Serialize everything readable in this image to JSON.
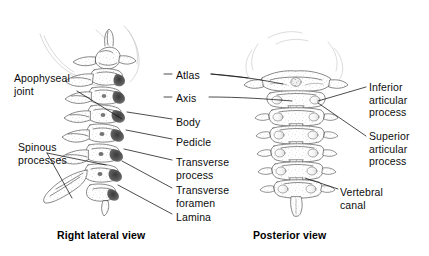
{
  "figure": {
    "background_color": "#ffffff",
    "ink_color": "#1a1a1a",
    "width": 429,
    "height": 256
  },
  "views": {
    "lateral": {
      "caption": "Right lateral view",
      "vertebra_count": 7
    },
    "posterior": {
      "caption": "Posterior view",
      "vertebra_count": 7
    }
  },
  "labels": {
    "apophyseal_joint": "Apophyseal\njoint",
    "spinous_processes": "Spinous\nprocesses",
    "atlas": "Atlas",
    "axis": "Axis",
    "body": "Body",
    "pedicle": "Pedicle",
    "transverse_process": "Transverse\nprocess",
    "transverse_foramen": "Transverse\nforamen",
    "lamina": "Lamina",
    "inferior_articular_process": "Inferior\narticular\nprocess",
    "superior_articular_process": "Superior\narticular\nprocess",
    "vertebral_canal": "Vertebral\ncanal"
  }
}
